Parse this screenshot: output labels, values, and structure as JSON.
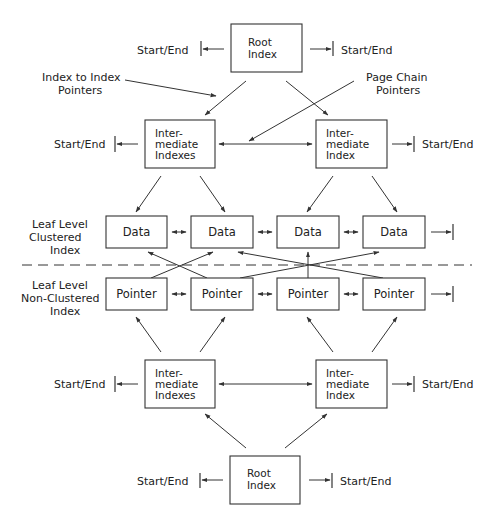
{
  "diagram": {
    "annotations": {
      "index_to_index": [
        "Index to Index",
        "Pointers"
      ],
      "page_chain": [
        "Page Chain",
        "Pointers"
      ]
    },
    "level_labels": {
      "clustered": [
        "Leaf Level",
        "Clustered",
        "Index"
      ],
      "nonclustered": [
        "Leaf Level",
        "Non-Clustered",
        "Index"
      ]
    },
    "start_end": "Start/End",
    "top_tree": {
      "root": [
        "Root",
        "Index"
      ],
      "intermediate_left": [
        "Inter-",
        "mediate",
        "Indexes"
      ],
      "intermediate_right": [
        "Inter-",
        "mediate",
        "Index"
      ],
      "leaf_nodes": [
        "Data",
        "Data",
        "Data",
        "Data"
      ]
    },
    "bottom_tree": {
      "leaf_nodes": [
        "Pointer",
        "Pointer",
        "Pointer",
        "Pointer"
      ],
      "intermediate_left": [
        "Inter-",
        "mediate",
        "Indexes"
      ],
      "intermediate_right": [
        "Inter-",
        "mediate",
        "Index"
      ],
      "root": [
        "Root",
        "Index"
      ]
    },
    "colors": {
      "line": "#333333",
      "background": "#ffffff",
      "text": "#222222"
    }
  }
}
